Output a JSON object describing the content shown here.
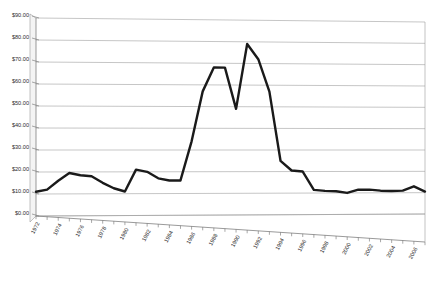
{
  "chart_data": {
    "type": "line",
    "title": "",
    "subtitle": "",
    "xlabel": "",
    "ylabel": "",
    "ylim": [
      0,
      90
    ],
    "y_tick_step": 10,
    "y_tick_labels": [
      "$0.00",
      "$10.00",
      "$20.00",
      "$30.00",
      "$40.00",
      "$50.00",
      "$60.00",
      "$70.00",
      "$80.00",
      "$90.00"
    ],
    "y_tick_values": [
      0,
      10,
      20,
      30,
      40,
      50,
      60,
      70,
      80,
      90
    ],
    "x_tick_labels": [
      "1972",
      "1974",
      "1976",
      "1978",
      "1980",
      "1982",
      "1984",
      "1986",
      "1988",
      "1990",
      "1992",
      "1994",
      "1996",
      "1998",
      "2000",
      "2002",
      "2004",
      "2006"
    ],
    "x_tick_values": [
      1972,
      1974,
      1976,
      1978,
      1980,
      1982,
      1984,
      1986,
      1988,
      1990,
      1992,
      1994,
      1996,
      1998,
      2000,
      2002,
      2004,
      2006
    ],
    "x_label_rotation": -62,
    "grid": true,
    "grid_axis": "y",
    "legend": false,
    "legend_position": "none",
    "projection": "3d-perspective",
    "x": [
      1972,
      1973,
      1974,
      1975,
      1976,
      1977,
      1978,
      1979,
      1980,
      1981,
      1982,
      1983,
      1984,
      1985,
      1986,
      1987,
      1988,
      1989,
      1990,
      1991,
      1992,
      1993,
      1994,
      1995,
      1996,
      1997,
      1998,
      1999,
      2000,
      2001,
      2002,
      2003,
      2004,
      2005,
      2006,
      2007
    ],
    "series": [
      {
        "name": "Price",
        "color": "#1a1a1a",
        "values": [
          11.0,
          12.0,
          16.0,
          19.5,
          18.5,
          18.0,
          15.0,
          12.5,
          11.0,
          21.0,
          20.0,
          17.0,
          16.0,
          16.0,
          34.0,
          57.0,
          68.0,
          68.0,
          49.0,
          79.0,
          72.0,
          57.0,
          25.0,
          20.5,
          20.0,
          11.5,
          11.0,
          10.8,
          10.0,
          11.5,
          11.5,
          11.0,
          10.8,
          11.0,
          13.0,
          10.5
        ]
      }
    ]
  },
  "axes": {
    "y_axis_name": "value-axis",
    "x_axis_name": "year-axis"
  }
}
